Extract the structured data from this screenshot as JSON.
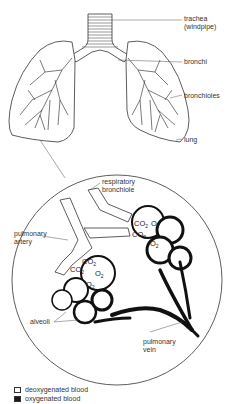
{
  "diagram": {
    "top_labels": {
      "trachea": "trachea",
      "trachea_sub": "(windpipe)",
      "bronchi": "bronchi",
      "bronchioles": "bronchioles",
      "lung": "lung"
    },
    "detail_labels": {
      "respiratory_bronchiole_1": "respiratory",
      "respiratory_bronchiole_2": "bronchiole",
      "pulmonary_artery_1": "pulmonary",
      "pulmonary_artery_2": "artery",
      "alveoli": "alveoli",
      "pulmonary_vein_1": "pulmonary",
      "pulmonary_vein_2": "vein"
    },
    "gases": {
      "co2": "CO",
      "o2": "O",
      "sub": "2"
    },
    "legend": [
      {
        "swatch": "white",
        "label": "deoxygenated blood"
      },
      {
        "swatch": "black",
        "label": "oxygenated blood"
      }
    ],
    "colors": {
      "line": "#333333",
      "oxygenated": "#1a1a1a",
      "deoxygenated": "#ffffff"
    }
  }
}
